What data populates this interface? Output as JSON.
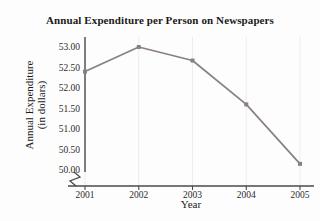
{
  "chart_data": {
    "type": "line",
    "title": "Annual Expenditure per Person on Newspapers",
    "xlabel": "Year",
    "ylabel_line1": "Annual Expenditure",
    "ylabel_line2": "(in dollars)",
    "categories": [
      "2001",
      "2002",
      "2003",
      "2004",
      "2005"
    ],
    "values": [
      52.4,
      53.0,
      52.67,
      51.6,
      50.15
    ],
    "x_tick_labels": [
      "2001",
      "2002",
      "2003",
      "2004",
      "2005"
    ],
    "y_tick_labels": [
      "50.00",
      "50.50",
      "51.00",
      "51.50",
      "52.00",
      "52.50",
      "53.00"
    ],
    "y_tick_values": [
      50.0,
      50.5,
      51.0,
      51.5,
      52.0,
      52.5,
      53.0
    ],
    "ylim": [
      50.0,
      53.0
    ],
    "grid": "vertical-faint",
    "legend": "none",
    "axis_break": "y-axis-origin-zigzag",
    "series_color": "#8a7f87",
    "marker_color": "#8a7f87",
    "marker_shape": "square",
    "axis_color": "#4a4a4a",
    "title_color": "#1a1a1a",
    "background_color": "#fdfdfd"
  }
}
